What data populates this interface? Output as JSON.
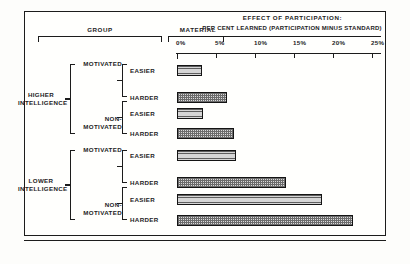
{
  "headers": {
    "group": "GROUP",
    "material": "MATERIAL",
    "effect_title": "EFFECT OF PARTICIPATION:",
    "effect_subtitle": "PER CENT LEARNED (PARTICIPATION MINUS STANDARD)"
  },
  "axis": {
    "ticks": [
      "0%",
      "5%",
      "10%",
      "15%",
      "20%",
      "25%"
    ]
  },
  "tree": {
    "intelligence": [
      {
        "line1": "HIGHER",
        "line2": "INTELLIGENCE"
      },
      {
        "line1": "LOWER",
        "line2": "INTELLIGENCE"
      }
    ],
    "motivation": [
      {
        "line1": "MOTIVATED",
        "line2": ""
      },
      {
        "line1": "NON-",
        "line2": "MOTIVATED"
      },
      {
        "line1": "MOTIVATED",
        "line2": ""
      },
      {
        "line1": "NON-",
        "line2": "MOTIVATED"
      }
    ],
    "material": [
      "EASIER",
      "HARDER",
      "EASIER",
      "HARDER",
      "EASIER",
      "HARDER",
      "EASIER",
      "HARDER"
    ]
  },
  "chart_data": {
    "type": "bar",
    "orientation": "horizontal",
    "title": "EFFECT OF PARTICIPATION:",
    "subtitle": "PER CENT LEARNED (PARTICIPATION MINUS STANDARD)",
    "xlabel": "PER CENT LEARNED (PARTICIPATION MINUS STANDARD)",
    "ylabel": "",
    "xlim": [
      0,
      26.5
    ],
    "xticks": [
      0,
      5,
      10,
      15,
      20,
      25
    ],
    "xticklabels": [
      "0%",
      "5%",
      "10%",
      "15%",
      "20%",
      "25%"
    ],
    "grid": false,
    "legend": false,
    "categories": [
      "HIGHER INTELLIGENCE / MOTIVATED / EASIER",
      "HIGHER INTELLIGENCE / MOTIVATED / HARDER",
      "HIGHER INTELLIGENCE / NON-MOTIVATED / EASIER",
      "HIGHER INTELLIGENCE / NON-MOTIVATED / HARDER",
      "LOWER INTELLIGENCE / MOTIVATED / EASIER",
      "LOWER INTELLIGENCE / MOTIVATED / HARDER",
      "LOWER INTELLIGENCE / NON-MOTIVATED / EASIER",
      "LOWER INTELLIGENCE / NON-MOTIVATED / HARDER"
    ],
    "values": [
      3.2,
      6.4,
      3.3,
      7.3,
      7.5,
      14.0,
      18.6,
      22.5
    ],
    "bars": [
      {
        "material": "EASIER",
        "value": 3.2
      },
      {
        "material": "HARDER",
        "value": 6.4
      },
      {
        "material": "EASIER",
        "value": 3.3
      },
      {
        "material": "HARDER",
        "value": 7.3
      },
      {
        "material": "EASIER",
        "value": 7.5
      },
      {
        "material": "HARDER",
        "value": 14.0
      },
      {
        "material": "EASIER",
        "value": 18.6
      },
      {
        "material": "HARDER",
        "value": 22.5
      }
    ]
  }
}
